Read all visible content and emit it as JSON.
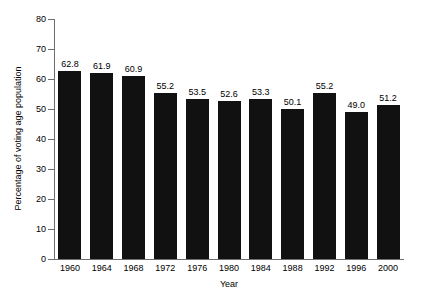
{
  "chart_data": {
    "type": "bar",
    "title": "",
    "xlabel": "Year",
    "ylabel": "Percentage of voting age population",
    "categories": [
      "1960",
      "1964",
      "1968",
      "1972",
      "1976",
      "1980",
      "1984",
      "1988",
      "1992",
      "1996",
      "2000"
    ],
    "values": [
      62.8,
      61.9,
      60.9,
      55.2,
      53.5,
      52.6,
      53.3,
      50.1,
      55.2,
      49.0,
      51.2
    ],
    "value_labels": [
      "62.8",
      "61.9",
      "60.9",
      "55.2",
      "53.5",
      "52.6",
      "53.3",
      "50.1",
      "55.2",
      "49.0",
      "51.2"
    ],
    "ylim": [
      0,
      80
    ],
    "yticks": [
      0,
      10,
      20,
      30,
      40,
      50,
      60,
      70,
      80
    ],
    "ytick_labels": [
      "0",
      "10",
      "20",
      "30",
      "40",
      "50",
      "60",
      "70",
      "80"
    ],
    "grid": false,
    "legend": null,
    "bar_color": "#111111",
    "axis_color": "#6e6e6e",
    "background": "#ffffff"
  }
}
